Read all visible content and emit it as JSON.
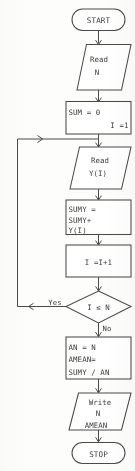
{
  "diagram": {
    "type": "flowchart",
    "colors": {
      "background": "#fdfdfc",
      "stroke": "#4a4a48",
      "shape_fill": "#ffffff",
      "text": "#3b3b39"
    },
    "nodes": [
      {
        "id": "start",
        "shape": "terminator",
        "lines": [
          "START"
        ]
      },
      {
        "id": "read-n",
        "shape": "parallelogram",
        "lines": [
          "Read",
          "N"
        ]
      },
      {
        "id": "init",
        "shape": "rectangle",
        "lines": [
          "SUM  = 0",
          "I  =1"
        ]
      },
      {
        "id": "read-y",
        "shape": "parallelogram",
        "lines": [
          "Read",
          "Y(I)"
        ]
      },
      {
        "id": "accumulate",
        "shape": "rectangle",
        "lines": [
          "SUMY  =",
          "SUMY+",
          "Y(I)"
        ]
      },
      {
        "id": "increment",
        "shape": "rectangle",
        "lines": [
          "I  =I+1"
        ]
      },
      {
        "id": "decision",
        "shape": "diamond",
        "lines": [
          "I ≤ N"
        ]
      },
      {
        "id": "compute-mean",
        "shape": "rectangle",
        "lines": [
          "AN  =  N",
          "AMEAN=",
          "SUMY / AN"
        ]
      },
      {
        "id": "write",
        "shape": "parallelogram",
        "lines": [
          "Write",
          "N",
          "AMEAN"
        ]
      },
      {
        "id": "stop",
        "shape": "terminator",
        "lines": [
          "STOP"
        ]
      }
    ],
    "edge_labels": {
      "yes": "Yes",
      "no": "No"
    }
  }
}
